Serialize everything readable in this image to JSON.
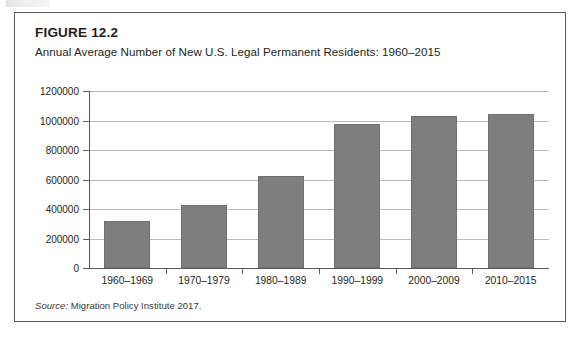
{
  "figure": {
    "label": "FIGURE 12.2",
    "title": "Annual Average Number of New U.S. Legal Permanent Residents: 1960–2015",
    "source_word": "Source:",
    "source_text": " Migration Policy Institute 2017."
  },
  "colors": {
    "bar_fill": "#7e7e7e",
    "bar_stroke": "#6f6f6f",
    "gridline": "#bdbdbd",
    "axis": "#58595b",
    "box_border": "#5a5a5a",
    "text": "#231f20",
    "background": "#ffffff"
  },
  "chart_data": {
    "type": "bar",
    "title": "Annual Average Number of New U.S. Legal Permanent Residents: 1960–2015",
    "xlabel": "",
    "ylabel": "",
    "categories": [
      "1960–1969",
      "1970–1979",
      "1980–1989",
      "1990–1999",
      "2000–2009",
      "2010–2015"
    ],
    "values": [
      321000,
      424000,
      624000,
      978000,
      1030000,
      1045000
    ],
    "ylim": [
      0,
      1200000
    ],
    "yticks": [
      0,
      200000,
      400000,
      600000,
      800000,
      1000000,
      1200000
    ],
    "ytick_labels": [
      "0",
      "200000",
      "400000",
      "600000",
      "800000",
      "1000000",
      "1200000"
    ],
    "grid": true,
    "legend": "none",
    "series": [
      {
        "name": "Annual average new legal permanent residents",
        "values": [
          321000,
          424000,
          624000,
          978000,
          1030000,
          1045000
        ]
      }
    ]
  }
}
